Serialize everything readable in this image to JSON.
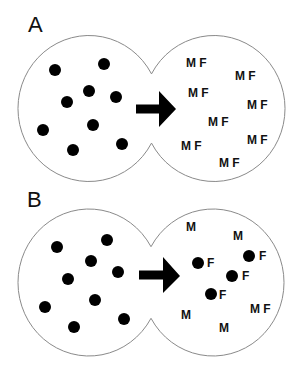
{
  "colors": {
    "outline": "#8a8a8a",
    "dot": "#000000",
    "arrow": "#000000",
    "text": "#111111",
    "background": "#ffffff"
  },
  "panels": [
    {
      "label": "A",
      "source": {
        "dot_count": 9
      },
      "arrow": "right-arrow",
      "result_items": [
        {
          "text": "M F",
          "dot": false
        },
        {
          "text": "M F",
          "dot": false
        },
        {
          "text": "M F",
          "dot": false
        },
        {
          "text": "M F",
          "dot": false
        },
        {
          "text": "M F",
          "dot": false
        },
        {
          "text": "M F",
          "dot": false
        },
        {
          "text": "M F",
          "dot": false
        },
        {
          "text": "M F",
          "dot": false
        }
      ]
    },
    {
      "label": "B",
      "source": {
        "dot_count": 9
      },
      "arrow": "right-arrow",
      "result_items": [
        {
          "text": "M",
          "dot": false
        },
        {
          "text": "M",
          "dot": false
        },
        {
          "text": "F",
          "dot": true
        },
        {
          "text": "F",
          "dot": true
        },
        {
          "text": "F",
          "dot": true
        },
        {
          "text": "F",
          "dot": true
        },
        {
          "text": "M",
          "dot": false
        },
        {
          "text": "M F",
          "dot": false
        },
        {
          "text": "M",
          "dot": false
        }
      ]
    }
  ]
}
